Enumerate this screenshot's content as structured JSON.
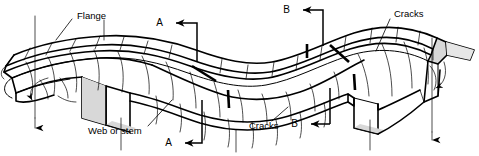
{
  "figure": {
    "kind": "engineering-line-drawing",
    "background_color": "#ffffff",
    "line_color": "#000000",
    "shade_color": "#d8d8d8"
  },
  "labels": {
    "flange": "Flange",
    "web_or_stem": "Web or stem",
    "cracks_top_right": "Cracks",
    "cracks_bottom_center": "Cracks"
  },
  "section_marks": {
    "a_top": "A",
    "a_bottom": "A",
    "b_top": "B",
    "b_bottom": "B"
  },
  "callouts": [
    {
      "name": "flange",
      "text": "Flange",
      "x": 75,
      "y": 17
    },
    {
      "name": "cracks-top-right",
      "text": "Cracks",
      "x": 393,
      "y": 15
    },
    {
      "name": "web-or-stem",
      "text": "Web or stem",
      "x": 88,
      "y": 131
    },
    {
      "name": "cracks-bottom-center",
      "text": "Cracks",
      "x": 250,
      "y": 126
    }
  ],
  "section_cuts": [
    {
      "name": "section-a",
      "label": "A",
      "top_label_x": 165,
      "top_label_y": 23,
      "bottom_label_x": 201,
      "bottom_label_y": 143
    },
    {
      "name": "section-b",
      "label": "B",
      "top_label_x": 292,
      "top_label_y": 10,
      "bottom_label_x": 326,
      "bottom_label_y": 124
    }
  ]
}
